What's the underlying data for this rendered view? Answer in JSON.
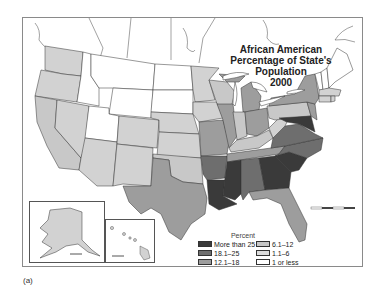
{
  "title": {
    "line1": "African American",
    "line2": "Percentage of State's Population",
    "line3": "2000"
  },
  "legend": {
    "header": "Percent",
    "items": [
      {
        "label": "More than 25",
        "color": "#3a3a3a"
      },
      {
        "label": "6.1–12",
        "color": "#c8c8c8"
      },
      {
        "label": "18.1–25",
        "color": "#6e6e6e"
      },
      {
        "label": "1.1–6",
        "color": "#dcdcdc"
      },
      {
        "label": "12.1–18",
        "color": "#9d9d9d"
      },
      {
        "label": "1 or less",
        "color": "#ffffff"
      }
    ]
  },
  "caption": "(a)",
  "colors": {
    "more_than_25": "#3a3a3a",
    "c18_25": "#6e6e6e",
    "c12_18": "#9d9d9d",
    "c6_12": "#c8c8c8",
    "c1_6": "#d2d2d2",
    "c1_or_less": "#ffffff",
    "border": "#333333",
    "frame": "#8a8a8a"
  },
  "insets": [
    "Alaska",
    "Hawaii"
  ]
}
